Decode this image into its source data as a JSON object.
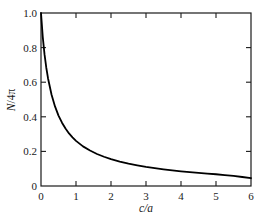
{
  "chart_data": {
    "type": "line",
    "title": "",
    "subtitle": "",
    "xlabel": "c/a",
    "ylabel": "N/4π",
    "xlim": [
      0,
      6
    ],
    "ylim": [
      0,
      1.0
    ],
    "grid": false,
    "legend": null,
    "xticks": [
      0,
      1,
      2,
      3,
      4,
      5,
      6
    ],
    "xtick_labels": [
      "0",
      "1",
      "2",
      "3",
      "4",
      "5",
      "6"
    ],
    "yticks": [
      0,
      0.2,
      0.4,
      0.6,
      0.8,
      1.0
    ],
    "ytick_labels": [
      "0",
      "0.2",
      "0.4",
      "0.6",
      "0.8",
      "1.0"
    ],
    "tick_direction": "in",
    "frame": "full-box",
    "series": [
      {
        "name": "N/4π vs c/a",
        "color": "#000000",
        "linewidth": 1.8,
        "x": [
          0.0,
          0.05,
          0.1,
          0.15,
          0.2,
          0.3,
          0.4,
          0.5,
          0.6,
          0.7,
          0.8,
          0.9,
          1.0,
          1.2,
          1.4,
          1.6,
          1.8,
          2.0,
          2.25,
          2.5,
          2.75,
          3.0,
          3.25,
          3.5,
          3.75,
          4.0,
          4.25,
          4.5,
          4.75,
          5.0,
          5.25,
          5.5,
          5.75,
          6.0
        ],
        "y": [
          1.0,
          0.862,
          0.762,
          0.685,
          0.623,
          0.529,
          0.46,
          0.407,
          0.366,
          0.332,
          0.304,
          0.281,
          0.261,
          0.229,
          0.205,
          0.185,
          0.169,
          0.155,
          0.141,
          0.129,
          0.119,
          0.11,
          0.103,
          0.096,
          0.09,
          0.085,
          0.08,
          0.076,
          0.072,
          0.068,
          0.063,
          0.058,
          0.052,
          0.045
        ]
      }
    ],
    "annotations": []
  },
  "axes": {
    "xlabel": "c/a",
    "ylabel_parts": {
      "n": "N",
      "rest": "/4π"
    },
    "xtick_labels": [
      "0",
      "1",
      "2",
      "3",
      "4",
      "5",
      "6"
    ],
    "ytick_labels": [
      "0",
      "0.2",
      "0.4",
      "0.6",
      "0.8",
      "1.0"
    ]
  },
  "colors": {
    "curve": "#000000",
    "axis": "#1a1a1a",
    "background": "#ffffff"
  }
}
